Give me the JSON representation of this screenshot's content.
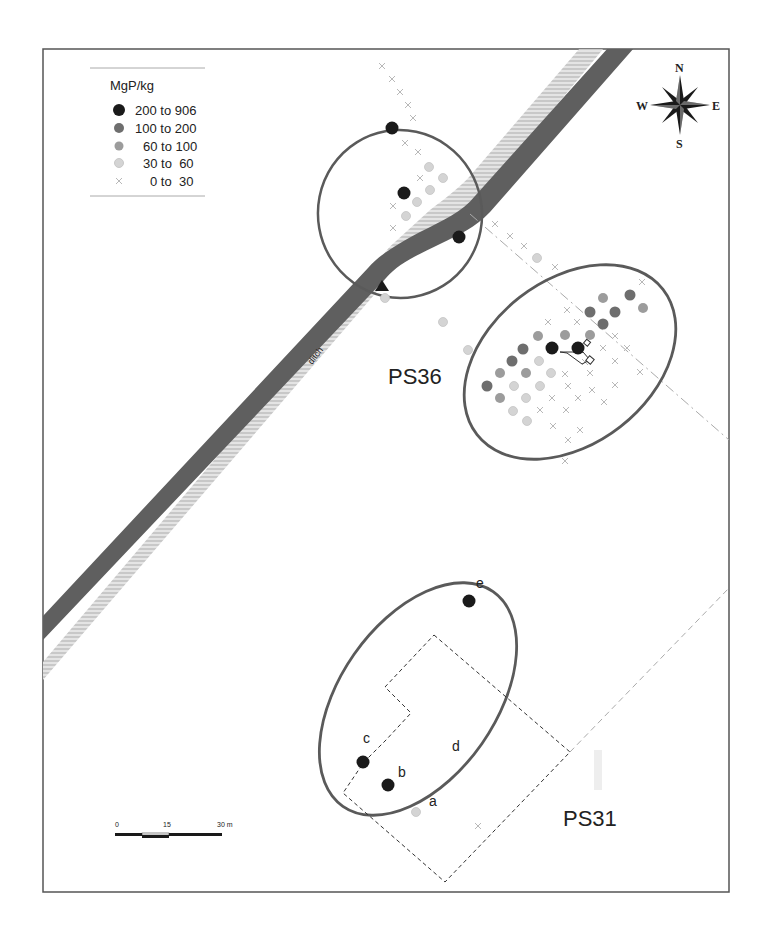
{
  "colors": {
    "frame": "#555555",
    "ellipse": "#5a5a5a",
    "ditch_dark": "#5f5f5f",
    "ditch_hatch": "#cfcfcf",
    "class_200_906": "#1a1a1a",
    "class_100_200": "#6e6e6e",
    "class_60_100": "#9c9c9c",
    "class_30_60": "#d4d4d4",
    "class_0_30": "#b0b0b0",
    "dashed": "#555555",
    "grid_dashed": "#bbbbbb"
  },
  "legend": {
    "title": "MgP/kg",
    "items": [
      {
        "label": "200 to 906",
        "class": "c1",
        "symbol": "dot",
        "color": "#1a1a1a"
      },
      {
        "label": "100 to 200",
        "class": "c2",
        "symbol": "dot",
        "color": "#6e6e6e"
      },
      {
        "label": "60 to 100",
        "class": "c3",
        "symbol": "dot",
        "color": "#9c9c9c"
      },
      {
        "label": "30 to  60",
        "class": "c4",
        "symbol": "dot",
        "color": "#d4d4d4"
      },
      {
        "label": "0 to  30",
        "class": "c5",
        "symbol": "cross",
        "color": "#b0b0b0"
      }
    ]
  },
  "compass": {
    "north": "N",
    "south": "S",
    "east": "E",
    "west": "W"
  },
  "scale_bar": {
    "ticks": [
      "0",
      "15",
      "30 m"
    ]
  },
  "labels": {
    "ditch": "ditch",
    "site_ps36": "PS36",
    "site_ps31": "PS31",
    "sample_a": "a",
    "sample_b": "b",
    "sample_c": "c",
    "sample_d": "d",
    "sample_e": "e"
  },
  "samples": {
    "north_cluster": [
      {
        "x": 392,
        "y": 128,
        "class": "c1"
      },
      {
        "x": 404,
        "y": 193,
        "class": "c1"
      },
      {
        "x": 459,
        "y": 237,
        "class": "c1"
      },
      {
        "x": 429,
        "y": 167,
        "class": "c4"
      },
      {
        "x": 443,
        "y": 178,
        "class": "c4"
      },
      {
        "x": 430,
        "y": 190,
        "class": "c4"
      },
      {
        "x": 417,
        "y": 202,
        "class": "c4"
      },
      {
        "x": 406,
        "y": 216,
        "class": "c4"
      },
      {
        "x": 537,
        "y": 258,
        "class": "c4"
      },
      {
        "x": 443,
        "y": 322,
        "class": "c4"
      },
      {
        "x": 468,
        "y": 350,
        "class": "c4"
      },
      {
        "x": 385,
        "y": 298,
        "class": "c4"
      }
    ],
    "ps36_cluster": [
      {
        "x": 630,
        "y": 295,
        "class": "c2"
      },
      {
        "x": 603,
        "y": 298,
        "class": "c3"
      },
      {
        "x": 643,
        "y": 308,
        "class": "c3"
      },
      {
        "x": 590,
        "y": 312,
        "class": "c2"
      },
      {
        "x": 615,
        "y": 312,
        "class": "c2"
      },
      {
        "x": 603,
        "y": 324,
        "class": "c2"
      },
      {
        "x": 538,
        "y": 336,
        "class": "c3"
      },
      {
        "x": 565,
        "y": 335,
        "class": "c3"
      },
      {
        "x": 590,
        "y": 335,
        "class": "c3"
      },
      {
        "x": 523,
        "y": 349,
        "class": "c2"
      },
      {
        "x": 552,
        "y": 348,
        "class": "c1"
      },
      {
        "x": 578,
        "y": 348,
        "class": "c1"
      },
      {
        "x": 512,
        "y": 361,
        "class": "c2"
      },
      {
        "x": 539,
        "y": 361,
        "class": "c4"
      },
      {
        "x": 500,
        "y": 373,
        "class": "c3"
      },
      {
        "x": 526,
        "y": 373,
        "class": "c3"
      },
      {
        "x": 551,
        "y": 373,
        "class": "c4"
      },
      {
        "x": 487,
        "y": 386,
        "class": "c2"
      },
      {
        "x": 514,
        "y": 386,
        "class": "c4"
      },
      {
        "x": 540,
        "y": 386,
        "class": "c4"
      },
      {
        "x": 500,
        "y": 398,
        "class": "c3"
      },
      {
        "x": 526,
        "y": 398,
        "class": "c4"
      },
      {
        "x": 513,
        "y": 411,
        "class": "c4"
      },
      {
        "x": 527,
        "y": 421,
        "class": "c4"
      }
    ],
    "ps31_cluster": [
      {
        "x": 469,
        "y": 601,
        "class": "c1",
        "label": "e"
      },
      {
        "x": 363,
        "y": 762,
        "class": "c1",
        "label": "c"
      },
      {
        "x": 388,
        "y": 785,
        "class": "c1",
        "label": "b"
      },
      {
        "x": 416,
        "y": 812,
        "class": "c4",
        "label": "a"
      }
    ]
  }
}
